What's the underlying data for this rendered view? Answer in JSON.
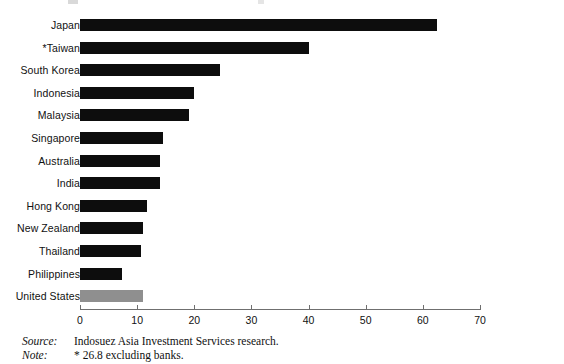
{
  "chart_data": {
    "type": "bar",
    "orientation": "horizontal",
    "title": "",
    "xlabel": "",
    "ylabel": "",
    "xlim": [
      0,
      70
    ],
    "xticks": [
      0,
      10,
      20,
      30,
      40,
      50,
      60,
      70
    ],
    "grid": false,
    "legend": null,
    "categories": [
      "Japan",
      "*Taiwan",
      "South Korea",
      "Indonesia",
      "Malaysia",
      "Singapore",
      "Australia",
      "India",
      "Hong Kong",
      "New Zealand",
      "Thailand",
      "Philippines",
      "United States"
    ],
    "values": [
      62.5,
      40.0,
      24.5,
      20.0,
      19.0,
      14.5,
      14.0,
      14.0,
      11.7,
      11.0,
      10.6,
      7.3,
      11.0
    ],
    "bar_colors": [
      "#0d0d0d",
      "#0d0d0d",
      "#0d0d0d",
      "#0d0d0d",
      "#0d0d0d",
      "#0d0d0d",
      "#0d0d0d",
      "#0d0d0d",
      "#0d0d0d",
      "#0d0d0d",
      "#0d0d0d",
      "#0d0d0d",
      "#8f8f8f"
    ],
    "highlight_color": "#8f8f8f",
    "series_color": "#0d0d0d"
  },
  "footnotes": [
    {
      "key": "Source:",
      "value": "Indosuez Asia Investment Services research."
    },
    {
      "key": "Note:",
      "value": "* 26.8 excluding banks."
    }
  ]
}
